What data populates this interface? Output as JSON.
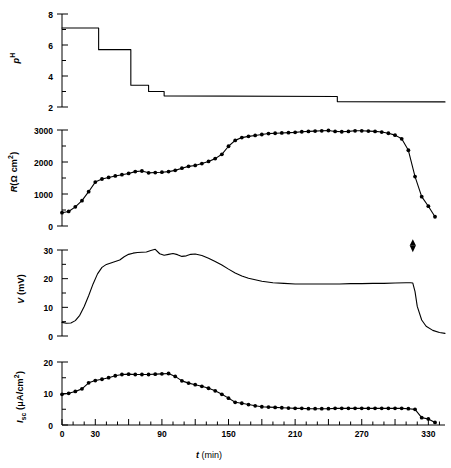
{
  "figure": {
    "background": "#ffffff",
    "ink": "#000000",
    "xlabel_italic": "t",
    "xlabel_unit": " (min)"
  },
  "chart_data": [
    {
      "type": "line",
      "id": "ph-panel",
      "title": "",
      "xlabel": "t (min)",
      "ylabel": "pH",
      "ylabel_parts": {
        "italic": "p",
        "superscript": "H"
      },
      "xlim": [
        0,
        345
      ],
      "ylim": [
        2,
        8
      ],
      "yticks": [
        2,
        4,
        6,
        8
      ],
      "yticklabels": [
        "2",
        "4",
        "6",
        "8"
      ],
      "yminorticks": [
        3,
        5,
        7
      ],
      "grid": false,
      "legend": "none",
      "style": "step",
      "x": [
        0,
        33,
        33,
        62,
        62,
        78,
        78,
        92,
        92,
        248,
        248,
        345
      ],
      "y": [
        7.1,
        7.1,
        5.7,
        5.7,
        3.4,
        3.4,
        3.0,
        3.0,
        2.72,
        2.68,
        2.35,
        2.33
      ],
      "steps": [
        {
          "from_min": 0,
          "to_min": 33,
          "ph": 7.1
        },
        {
          "from_min": 33,
          "to_min": 62,
          "ph": 5.7
        },
        {
          "from_min": 62,
          "to_min": 78,
          "ph": 3.4
        },
        {
          "from_min": 78,
          "to_min": 92,
          "ph": 3.0
        },
        {
          "from_min": 92,
          "to_min": 248,
          "ph": 2.7
        },
        {
          "from_min": 248,
          "to_min": 345,
          "ph": 2.35
        }
      ]
    },
    {
      "type": "line",
      "id": "resistance-panel",
      "title": "",
      "xlabel": "t (min)",
      "ylabel": "R(Ω cm²)",
      "ylabel_parts": {
        "italic": "R",
        "rest": "(Ω cm",
        "superscript": "2",
        "close": ")"
      },
      "xlim": [
        0,
        345
      ],
      "ylim": [
        0,
        3300
      ],
      "yticks": [
        0,
        1000,
        2000,
        3000
      ],
      "yticklabels": [
        "0",
        "1000",
        "2000",
        "3000"
      ],
      "yminorticks": [
        500,
        1500,
        2500
      ],
      "grid": false,
      "legend": "none",
      "markers": "filled-circle",
      "x": [
        0,
        6,
        12,
        18,
        24,
        30,
        36,
        42,
        48,
        54,
        60,
        66,
        72,
        78,
        84,
        90,
        96,
        102,
        108,
        114,
        120,
        126,
        132,
        138,
        144,
        150,
        156,
        162,
        168,
        174,
        180,
        186,
        192,
        198,
        204,
        210,
        216,
        222,
        228,
        234,
        240,
        246,
        252,
        258,
        264,
        270,
        276,
        282,
        288,
        294,
        300,
        306,
        312,
        318,
        324,
        330,
        336
      ],
      "y": [
        430,
        470,
        620,
        820,
        1110,
        1420,
        1520,
        1570,
        1620,
        1660,
        1700,
        1760,
        1780,
        1720,
        1730,
        1740,
        1760,
        1800,
        1870,
        1930,
        1960,
        2020,
        2090,
        2180,
        2320,
        2580,
        2770,
        2860,
        2900,
        2930,
        2960,
        2990,
        3000,
        3010,
        3020,
        3030,
        3050,
        3060,
        3070,
        3080,
        3090,
        3060,
        3050,
        3060,
        3080,
        3080,
        3070,
        3060,
        3040,
        3000,
        2940,
        2820,
        2450,
        1600,
        950,
        640,
        300
      ]
    },
    {
      "type": "line",
      "id": "voltage-panel",
      "title": "",
      "xlabel": "t (min)",
      "ylabel": "V (mV)",
      "ylabel_parts": {
        "italic": "V",
        "rest": " (mV)"
      },
      "xlim": [
        0,
        345
      ],
      "ylim": [
        0,
        32
      ],
      "yticks": [
        0,
        10,
        20,
        30
      ],
      "yticklabels": [
        "0",
        "10",
        "20",
        "30"
      ],
      "yminorticks": [
        5,
        15,
        25
      ],
      "grid": false,
      "legend": "none",
      "markers": "none",
      "annotation": {
        "label": "double-arrow",
        "x_min": 316,
        "y_mv": 29
      },
      "x": [
        0,
        4,
        8,
        12,
        16,
        20,
        24,
        28,
        32,
        36,
        40,
        44,
        48,
        52,
        56,
        60,
        64,
        68,
        72,
        76,
        80,
        84,
        88,
        92,
        96,
        100,
        104,
        108,
        112,
        116,
        120,
        126,
        132,
        138,
        144,
        150,
        156,
        162,
        168,
        174,
        180,
        190,
        200,
        210,
        220,
        230,
        240,
        250,
        260,
        270,
        280,
        290,
        300,
        310,
        314,
        316,
        318,
        320,
        324,
        328,
        334,
        340,
        345
      ],
      "y": [
        4.6,
        4.3,
        4.4,
        5.2,
        7.0,
        10.0,
        13.6,
        17.6,
        21.0,
        23.2,
        24.2,
        24.7,
        25.2,
        25.7,
        26.8,
        27.6,
        28.0,
        28.2,
        28.3,
        28.4,
        28.9,
        29.3,
        27.8,
        27.3,
        27.6,
        27.9,
        27.5,
        26.9,
        27.1,
        27.6,
        27.7,
        27.2,
        26.3,
        25.2,
        24.0,
        22.6,
        21.3,
        20.3,
        19.5,
        19.0,
        18.5,
        18.0,
        17.8,
        17.6,
        17.6,
        17.6,
        17.6,
        17.6,
        17.7,
        17.7,
        17.8,
        17.8,
        17.9,
        18.0,
        18.0,
        17.9,
        15.0,
        10.0,
        5.4,
        3.3,
        1.9,
        1.2,
        0.9
      ]
    },
    {
      "type": "line",
      "id": "short-circuit-current-panel",
      "title": "",
      "xlabel": "t (min)",
      "ylabel": "I_sc (μA/cm²)",
      "ylabel_parts": {
        "italic": "I",
        "subscript": "sc",
        "rest": " (μA/cm",
        "superscript": "2",
        "close": ")"
      },
      "xlim": [
        0,
        345
      ],
      "ylim": [
        0,
        21
      ],
      "yticks": [
        0,
        10,
        20
      ],
      "yticklabels": [
        "0",
        "10",
        "20"
      ],
      "yminorticks": [
        5,
        15
      ],
      "xticks": [
        0,
        30,
        60,
        90,
        120,
        150,
        180,
        210,
        240,
        270,
        300,
        330
      ],
      "xticklabels": [
        "0",
        "30",
        "",
        "90",
        "",
        "150",
        "",
        "210",
        "",
        "270",
        "",
        "330"
      ],
      "xminorticks": [
        10,
        20,
        40,
        50,
        70,
        80,
        100,
        110,
        130,
        140,
        160,
        170,
        190,
        200,
        220,
        230,
        250,
        260,
        280,
        290,
        310,
        320,
        340
      ],
      "grid": false,
      "legend": "none",
      "markers": "filled-circle",
      "x": [
        0,
        6,
        12,
        18,
        24,
        30,
        36,
        42,
        48,
        54,
        60,
        66,
        72,
        78,
        84,
        90,
        96,
        102,
        108,
        114,
        120,
        126,
        132,
        138,
        144,
        150,
        156,
        162,
        168,
        174,
        180,
        186,
        192,
        198,
        204,
        210,
        216,
        222,
        228,
        234,
        240,
        246,
        252,
        258,
        264,
        270,
        276,
        282,
        288,
        294,
        300,
        306,
        312,
        318,
        324,
        330,
        336
      ],
      "y": [
        9.6,
        9.9,
        10.5,
        11.3,
        13.2,
        13.9,
        14.3,
        14.8,
        15.4,
        15.8,
        15.9,
        15.8,
        15.8,
        15.8,
        15.9,
        16.0,
        16.1,
        15.2,
        13.8,
        13.1,
        12.6,
        12.1,
        11.5,
        10.7,
        9.6,
        8.4,
        7.1,
        6.8,
        6.4,
        6.0,
        5.7,
        5.6,
        5.5,
        5.4,
        5.3,
        5.2,
        5.2,
        5.1,
        5.1,
        5.1,
        5.1,
        5.2,
        5.2,
        5.2,
        5.2,
        5.2,
        5.2,
        5.2,
        5.2,
        5.2,
        5.2,
        5.2,
        5.1,
        4.9,
        2.3,
        1.9,
        0.8
      ]
    }
  ]
}
